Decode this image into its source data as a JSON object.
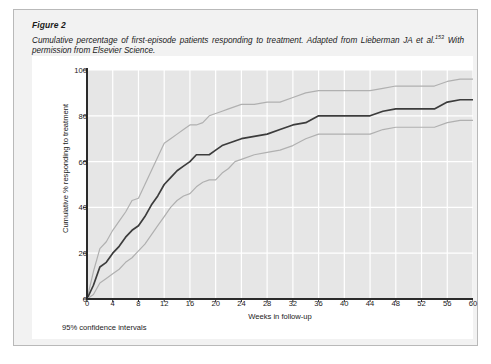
{
  "figure": {
    "label": "Figure 2",
    "caption_part1": "Cumulative percentage of first-episode patients responding to treatment. Adapted from Lieberman JA et al.",
    "caption_citation": "153",
    "caption_part2": "With permission from Elsevier Science.",
    "footnote": "95% confidence intervals"
  },
  "colors": {
    "panel_background": "#f2f2f2",
    "panel_border": "#b9b9b9",
    "chart_background": "#ffffff",
    "plot_background": "#e6e6e6",
    "gridline": "#ffffff",
    "axis": "#2b2b2b",
    "central_line": "#3c3c3c",
    "ci_line": "#b0b0b0",
    "text": "#1a1a1a"
  },
  "chart_data": {
    "type": "line",
    "title": "",
    "xlabel": "Weeks in follow-up",
    "ylabel": "Cumulative % responding to treatment",
    "xlim": [
      0,
      60
    ],
    "ylim": [
      0,
      100
    ],
    "xticks": [
      0,
      4,
      8,
      12,
      16,
      20,
      24,
      28,
      32,
      36,
      40,
      44,
      48,
      52,
      56,
      60
    ],
    "yticks": [
      0,
      20,
      40,
      60,
      80,
      100
    ],
    "grid": true,
    "legend": "none",
    "annotations": [
      "95% confidence intervals"
    ],
    "x": [
      0,
      1,
      2,
      3,
      4,
      5,
      6,
      7,
      8,
      9,
      10,
      11,
      12,
      13,
      14,
      15,
      16,
      17,
      18,
      19,
      20,
      21,
      22,
      23,
      24,
      26,
      28,
      30,
      32,
      34,
      36,
      38,
      40,
      42,
      44,
      46,
      48,
      50,
      52,
      54,
      56,
      58,
      60
    ],
    "series": [
      {
        "name": "Upper 95% confidence limit",
        "style": "light-gray",
        "values": [
          0,
          12,
          22,
          25,
          30,
          34,
          38,
          43,
          44,
          50,
          56,
          62,
          68,
          70,
          72,
          74,
          76,
          76,
          77,
          80,
          81,
          82,
          83,
          84,
          85,
          85,
          86,
          86,
          88,
          90,
          91,
          91,
          91,
          91,
          91,
          92,
          93,
          93,
          93,
          93,
          95,
          96,
          96
        ]
      },
      {
        "name": "Central estimate",
        "style": "dark",
        "values": [
          0,
          6,
          14,
          16,
          20,
          23,
          27,
          30,
          32,
          36,
          41,
          45,
          50,
          53,
          56,
          58,
          60,
          63,
          63,
          63,
          65,
          67,
          68,
          69,
          70,
          71,
          72,
          74,
          76,
          77,
          80,
          80,
          80,
          80,
          80,
          82,
          83,
          83,
          83,
          83,
          86,
          87,
          87
        ]
      },
      {
        "name": "Lower 95% confidence limit",
        "style": "light-gray",
        "values": [
          0,
          2,
          7,
          9,
          11,
          13,
          16,
          18,
          21,
          24,
          28,
          32,
          36,
          40,
          43,
          45,
          46,
          49,
          51,
          52,
          52,
          55,
          57,
          60,
          61,
          63,
          64,
          65,
          67,
          70,
          72,
          72,
          72,
          72,
          72,
          74,
          75,
          75,
          75,
          75,
          77,
          78,
          78
        ]
      }
    ]
  }
}
